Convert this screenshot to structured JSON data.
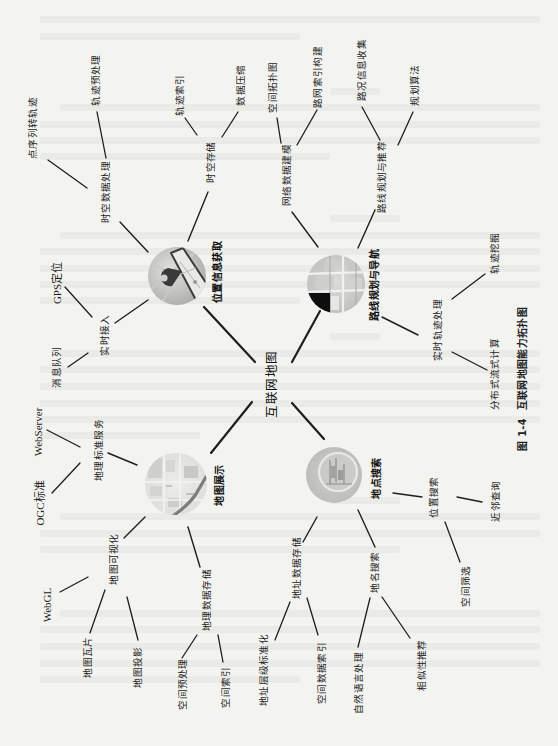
{
  "colors": {
    "paper": "#f3f3f0",
    "ink": "#1e1e1e",
    "bleed_through": "#e7e7e3"
  },
  "diagram": {
    "root": {
      "label": "互联网地图"
    },
    "branches": [
      {
        "label": "位置信息获取",
        "image": "location-pin-on-phone-map",
        "children": [
          {
            "label": "时空数据处理",
            "children": [
              {
                "label": "点序列转轨迹"
              },
              {
                "label": "轨迹预处理"
              }
            ]
          },
          {
            "label": "时空存储",
            "children": [
              {
                "label": "轨迹索引"
              },
              {
                "label": "数据压缩"
              }
            ]
          },
          {
            "label": "实时接入",
            "children": [
              {
                "label": "GPS定位"
              },
              {
                "label": "消息队列"
              }
            ]
          }
        ]
      },
      {
        "label": "路线规划与导航",
        "image": "street-map-navigation",
        "children": [
          {
            "label": "网络数据建模",
            "children": [
              {
                "label": "空间拓扑图"
              },
              {
                "label": "路网索引构建"
              }
            ]
          },
          {
            "label": "路线规划与推荐",
            "children": [
              {
                "label": "路况信息收集"
              },
              {
                "label": "规划算法"
              }
            ]
          },
          {
            "label": "实时轨迹处理",
            "children": [
              {
                "label": "轨迹挖掘"
              },
              {
                "label": "分布式流式计算"
              }
            ]
          }
        ]
      },
      {
        "label": "地图展示",
        "image": "city-map-with-road",
        "children": [
          {
            "label": "地理标准服务",
            "children": [
              {
                "label": "WebServer"
              },
              {
                "label": "OGC标准"
              }
            ]
          },
          {
            "label": "地图可视化",
            "children": [
              {
                "label": "WebGL"
              },
              {
                "label": "地图瓦片"
              },
              {
                "label": "地图投影"
              }
            ]
          },
          {
            "label": "地理数据存储",
            "children": [
              {
                "label": "空间预处理"
              },
              {
                "label": "空间索引"
              }
            ]
          }
        ]
      },
      {
        "label": "地点搜索",
        "image": "magnifier-over-map",
        "children": [
          {
            "label": "地址数据存储",
            "children": [
              {
                "label": "地址层级标准化"
              },
              {
                "label": "空间数据索引"
              }
            ]
          },
          {
            "label": "地名搜索",
            "children": [
              {
                "label": "自然语言处理"
              },
              {
                "label": "相似性推荐"
              }
            ]
          },
          {
            "label": "位置搜索",
            "children": [
              {
                "label": "空间筛选"
              },
              {
                "label": "近邻查询"
              }
            ]
          }
        ]
      }
    ]
  },
  "caption": {
    "number": "图 1-4",
    "title": "互联网地图能力拓扑图"
  }
}
